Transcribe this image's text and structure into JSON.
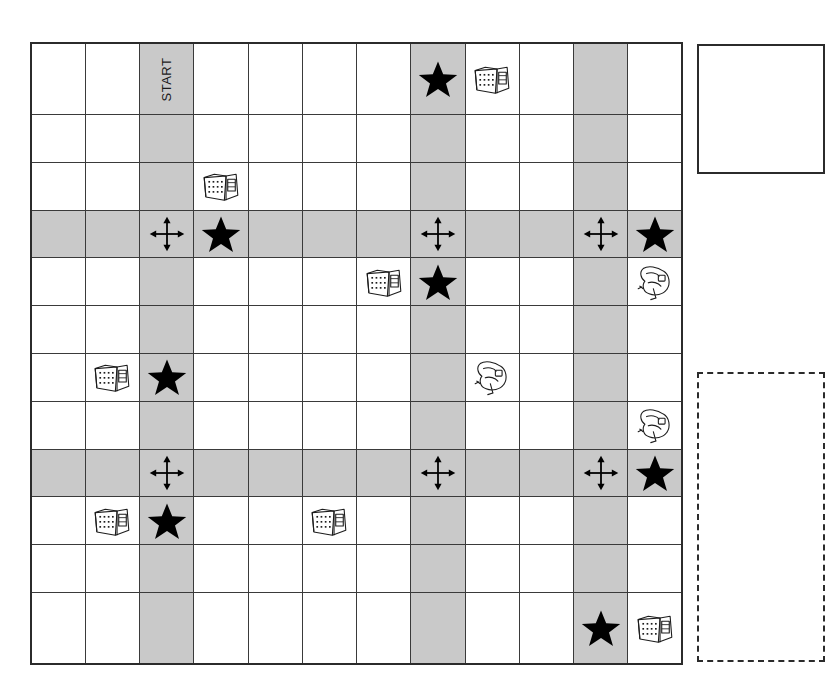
{
  "board": {
    "columns": 12,
    "rows": 12,
    "shaded_columns": [
      3,
      8,
      11
    ],
    "shaded_rows": [
      4,
      9
    ],
    "start_label": "START",
    "colors": {
      "grid_line": "#3a3a3a",
      "border": "#2b2b2b",
      "shade": "#c9c9c9",
      "cell": "#ffffff",
      "figure": "#000000"
    },
    "cells": [
      {
        "row": 1,
        "col": 3,
        "type": "start-label",
        "label": "START"
      },
      {
        "row": 1,
        "col": 8,
        "type": "star"
      },
      {
        "row": 1,
        "col": 9,
        "type": "building-icon"
      },
      {
        "row": 3,
        "col": 4,
        "type": "building-icon"
      },
      {
        "row": 4,
        "col": 3,
        "type": "four-way-arrows"
      },
      {
        "row": 4,
        "col": 4,
        "type": "star"
      },
      {
        "row": 4,
        "col": 8,
        "type": "four-way-arrows"
      },
      {
        "row": 4,
        "col": 11,
        "type": "four-way-arrows"
      },
      {
        "row": 4,
        "col": 12,
        "type": "star"
      },
      {
        "row": 5,
        "col": 7,
        "type": "building-icon"
      },
      {
        "row": 5,
        "col": 8,
        "type": "star"
      },
      {
        "row": 5,
        "col": 12,
        "type": "sketch-icon"
      },
      {
        "row": 7,
        "col": 2,
        "type": "building-icon"
      },
      {
        "row": 7,
        "col": 3,
        "type": "star"
      },
      {
        "row": 7,
        "col": 9,
        "type": "sketch-icon"
      },
      {
        "row": 8,
        "col": 12,
        "type": "sketch-icon"
      },
      {
        "row": 9,
        "col": 3,
        "type": "four-way-arrows"
      },
      {
        "row": 9,
        "col": 8,
        "type": "four-way-arrows"
      },
      {
        "row": 9,
        "col": 11,
        "type": "four-way-arrows"
      },
      {
        "row": 9,
        "col": 12,
        "type": "star"
      },
      {
        "row": 10,
        "col": 2,
        "type": "building-icon"
      },
      {
        "row": 10,
        "col": 3,
        "type": "star"
      },
      {
        "row": 10,
        "col": 6,
        "type": "building-icon"
      },
      {
        "row": 12,
        "col": 11,
        "type": "star"
      },
      {
        "row": 12,
        "col": 12,
        "type": "building-icon"
      }
    ]
  },
  "side_panels": {
    "top_box": {
      "label": "",
      "border_style": "solid"
    },
    "bottom_box": {
      "label": "",
      "border_style": "dashed"
    }
  }
}
